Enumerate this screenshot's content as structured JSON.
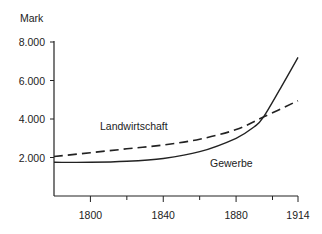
{
  "chart_data": {
    "type": "line",
    "title": "",
    "xlabel": "",
    "ylabel": "Mark",
    "x_ticks": [
      1800,
      1840,
      1880,
      1914
    ],
    "x_tick_labels": [
      "1800",
      "1840",
      "1880",
      "1914"
    ],
    "x_minor_ticks": [
      1820,
      1860,
      1900
    ],
    "y_ticks": [
      2000,
      4000,
      6000,
      8000
    ],
    "y_tick_labels": [
      "2.000",
      "4.000",
      "6.000",
      "8.000"
    ],
    "xlim": [
      1780,
      1914
    ],
    "ylim": [
      0,
      8000
    ],
    "grid": false,
    "legend": "inline labels",
    "series": [
      {
        "name": "Landwirtschaft",
        "style": "dashed",
        "x": [
          1780,
          1800,
          1820,
          1840,
          1860,
          1880,
          1895,
          1914
        ],
        "values": [
          2050,
          2250,
          2450,
          2650,
          2950,
          3450,
          4100,
          4950
        ]
      },
      {
        "name": "Gewerbe",
        "style": "solid",
        "x": [
          1780,
          1800,
          1820,
          1840,
          1860,
          1880,
          1890,
          1895,
          1905,
          1914
        ],
        "values": [
          1750,
          1750,
          1800,
          1950,
          2300,
          3000,
          3600,
          4100,
          5700,
          7200
        ]
      }
    ]
  },
  "labels": {
    "ylabel": "Mark",
    "series_a": "Landwirtschaft",
    "series_b": "Gewerbe"
  }
}
